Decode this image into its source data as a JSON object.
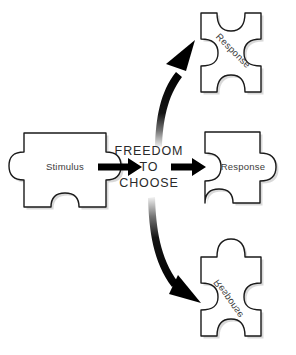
{
  "diagram": {
    "background_color": "#ffffff",
    "outline_color": "#1a1a1a",
    "text_color": "#3b3b3b",
    "arrow_color": "#000000"
  },
  "center": {
    "line1": "FREEDOM",
    "line2": "TO",
    "line3": "CHOOSE"
  },
  "pieces": {
    "stimulus": {
      "label": "Stimulus",
      "rotation": 0
    },
    "response_top": {
      "label": "Response",
      "rotation": 45
    },
    "response_middle": {
      "label": "Response",
      "rotation": 0
    },
    "response_bottom": {
      "label": "Response",
      "rotation": 55
    }
  },
  "arrows": {
    "stimulus_to_center": "arrow-right-icon",
    "center_to_middle": "arrow-right-icon",
    "center_to_top": "curved-arrow-up-icon",
    "center_to_bottom": "curved-arrow-down-icon"
  }
}
